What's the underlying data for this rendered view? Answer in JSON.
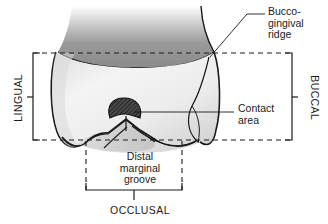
{
  "figure": {
    "type": "dental-anatomy-diagram",
    "background_color": "#ffffff",
    "line_color": "#1a1a1a",
    "enamel_fill": "#f0f0f0",
    "root_shade": "#8f8f8f",
    "contact_area_fill": "#3a3a3a"
  },
  "labels": {
    "bucco_gingival_ridge": "Bucco-\ngingival\nridge",
    "contact_area": "Contact\narea",
    "distal_marginal_groove": "Distal\nmarginal\ngroove",
    "occlusal": "OCCLUSAL",
    "lingual": "LINGUAL",
    "buccal": "BUCCAL"
  }
}
